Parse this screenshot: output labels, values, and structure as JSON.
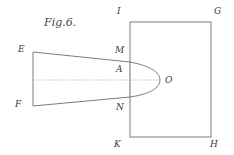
{
  "figure": {
    "title": "Fig.6.",
    "labels": {
      "E": "E",
      "F": "F",
      "I": "I",
      "G": "G",
      "M": "M",
      "A": "A",
      "O": "O",
      "N": "N",
      "K": "K",
      "H": "H"
    },
    "colors": {
      "line": "#6e6e6e",
      "dotted": "#9a9a9a",
      "text": "#3a3a3a",
      "background": "#ffffff"
    }
  }
}
